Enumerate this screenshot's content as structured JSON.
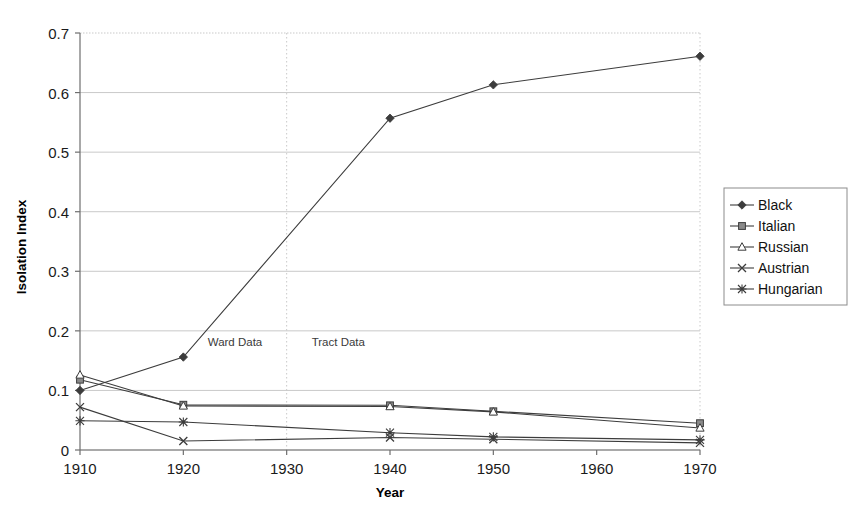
{
  "chart_data": {
    "type": "line",
    "title": "",
    "xlabel": "Year",
    "ylabel": "Isolation Index",
    "x": [
      1910,
      1920,
      1940,
      1950,
      1970
    ],
    "xlim": [
      1910,
      1970
    ],
    "ylim": [
      0,
      0.7
    ],
    "xticks": [
      "1910",
      "1920",
      "1930",
      "1940",
      "1950",
      "1960",
      "1970"
    ],
    "xtick_values": [
      1910,
      1920,
      1930,
      1940,
      1950,
      1960,
      1970
    ],
    "yticks": [
      "0",
      "0.1",
      "0.2",
      "0.3",
      "0.4",
      "0.5",
      "0.6",
      "0.7"
    ],
    "ytick_values": [
      0,
      0.1,
      0.2,
      0.3,
      0.4,
      0.5,
      0.6,
      0.7
    ],
    "grid": "horizontal",
    "legend_position": "right",
    "series": [
      {
        "name": "Black",
        "marker": "diamond",
        "values": [
          0.1,
          0.156,
          0.557,
          0.613,
          0.661
        ]
      },
      {
        "name": "Italian",
        "marker": "square",
        "values": [
          0.118,
          0.076,
          0.075,
          0.065,
          0.045
        ]
      },
      {
        "name": "Russian",
        "marker": "triangle",
        "values": [
          0.126,
          0.074,
          0.073,
          0.064,
          0.037
        ]
      },
      {
        "name": "Austrian",
        "marker": "x",
        "values": [
          0.072,
          0.015,
          0.021,
          0.018,
          0.012
        ]
      },
      {
        "name": "Hungarian",
        "marker": "star",
        "values": [
          0.049,
          0.047,
          0.029,
          0.022,
          0.017
        ]
      }
    ],
    "annotations": [
      {
        "text": "Ward Data",
        "x": 1925,
        "y": 0.175
      },
      {
        "text": "Tract Data",
        "x": 1935,
        "y": 0.175
      }
    ],
    "divider": {
      "x": 1930,
      "style": "dotted"
    }
  },
  "legend": {
    "items": [
      {
        "label": "Black"
      },
      {
        "label": "Italian"
      },
      {
        "label": "Russian"
      },
      {
        "label": "Austrian"
      },
      {
        "label": "Hungarian"
      }
    ]
  },
  "colors": {
    "line": "#3c3c3c",
    "grid": "#c9c9c9",
    "axis": "#6e6e6e",
    "text": "#1a1a1a",
    "background": "#ffffff"
  }
}
